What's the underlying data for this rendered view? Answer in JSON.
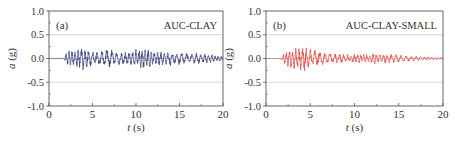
{
  "chart_data": [
    {
      "type": "line",
      "panel_label": "(a)",
      "title": "AUC-CLAY",
      "xlabel": "t (s)",
      "ylabel": "a (g)",
      "xlim": [
        0,
        20
      ],
      "ylim": [
        -1.0,
        1.0
      ],
      "xticks": [
        0,
        5,
        10,
        15,
        20
      ],
      "xtick_labels": [
        "0",
        "5",
        "10",
        "15",
        "20"
      ],
      "yticks": [
        1.0,
        0.5,
        0.0,
        -0.5,
        -1.0
      ],
      "ytick_labels": [
        "1.0",
        "0.5",
        "0.0",
        "-0.5",
        "-1.0"
      ],
      "grid": {
        "horizontal": [
          0.5,
          0.0,
          -0.5
        ],
        "vertical": false
      },
      "line_color": "#3d4179",
      "series": [
        {
          "name": "AUC-CLAY acceleration",
          "description": "Ground motion acceleration time history; quiet until ~1.8 s, then oscillation with peaks about +/-0.25 g between 2-12 s, gradually decaying to ~+/-0.08 g by 20 s",
          "onset_s": 1.8,
          "envelope": [
            {
              "t": 0.0,
              "amp": 0.0
            },
            {
              "t": 1.7,
              "amp": 0.01
            },
            {
              "t": 2.0,
              "amp": 0.15
            },
            {
              "t": 3.0,
              "amp": 0.18
            },
            {
              "t": 4.0,
              "amp": 0.25
            },
            {
              "t": 5.0,
              "amp": 0.2
            },
            {
              "t": 6.0,
              "amp": 0.17
            },
            {
              "t": 7.0,
              "amp": 0.2
            },
            {
              "t": 8.0,
              "amp": 0.17
            },
            {
              "t": 9.0,
              "amp": 0.16
            },
            {
              "t": 10.0,
              "amp": 0.18
            },
            {
              "t": 10.8,
              "amp": 0.24
            },
            {
              "t": 12.0,
              "amp": 0.17
            },
            {
              "t": 14.0,
              "amp": 0.15
            },
            {
              "t": 16.0,
              "amp": 0.13
            },
            {
              "t": 18.0,
              "amp": 0.1
            },
            {
              "t": 20.0,
              "amp": 0.06
            }
          ],
          "peak_positive_g": 0.25,
          "peak_negative_g": -0.25
        }
      ]
    },
    {
      "type": "line",
      "panel_label": "(b)",
      "title": "AUC-CLAY-SMALL",
      "xlabel": "t (s)",
      "ylabel": "a (g)",
      "xlim": [
        0,
        20
      ],
      "ylim": [
        -1.0,
        1.0
      ],
      "xticks": [
        0,
        5,
        10,
        15,
        20
      ],
      "xtick_labels": [
        "0",
        "5",
        "10",
        "15",
        "20"
      ],
      "yticks": [
        1.0,
        0.5,
        0.0,
        -0.5,
        -1.0
      ],
      "ytick_labels": [
        "1.0",
        "0.5",
        "0.0",
        "-0.5",
        "-1.0"
      ],
      "grid": {
        "horizontal": [
          0.5,
          0.0,
          -0.5
        ],
        "vertical": false
      },
      "line_color": "#e0504a",
      "series": [
        {
          "name": "AUC-CLAY-SMALL acceleration",
          "description": "Ground motion acceleration time history; quiet until ~1.8 s, strong burst peaking ~+/-0.27 g around 3-5 s, decaying to ~+/-0.1 g after 8 s and ~+/-0.03 g by 20 s",
          "onset_s": 1.8,
          "envelope": [
            {
              "t": 0.0,
              "amp": 0.0
            },
            {
              "t": 1.7,
              "amp": 0.01
            },
            {
              "t": 2.0,
              "amp": 0.12
            },
            {
              "t": 2.6,
              "amp": 0.22
            },
            {
              "t": 3.5,
              "amp": 0.25
            },
            {
              "t": 4.6,
              "amp": 0.27
            },
            {
              "t": 5.5,
              "amp": 0.18
            },
            {
              "t": 6.5,
              "amp": 0.15
            },
            {
              "t": 7.5,
              "amp": 0.12
            },
            {
              "t": 9.0,
              "amp": 0.09
            },
            {
              "t": 10.5,
              "amp": 0.1
            },
            {
              "t": 12.5,
              "amp": 0.12
            },
            {
              "t": 14.5,
              "amp": 0.09
            },
            {
              "t": 16.5,
              "amp": 0.06
            },
            {
              "t": 18.0,
              "amp": 0.04
            },
            {
              "t": 20.0,
              "amp": 0.025
            }
          ],
          "peak_positive_g": 0.27,
          "peak_negative_g": -0.27
        }
      ]
    }
  ],
  "layout": {
    "panels": [
      {
        "x0": 49,
        "x1": 223,
        "y0": 11,
        "y1": 106
      },
      {
        "x0": 266,
        "x1": 443,
        "y0": 11,
        "y1": 106
      }
    ],
    "grid_color": "#cfcfcf",
    "axis_color": "#555555"
  }
}
